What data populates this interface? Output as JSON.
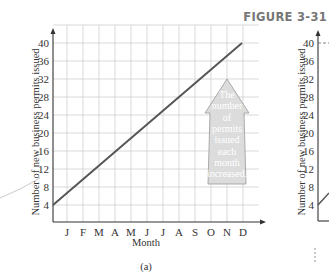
{
  "figure_title": "FIGURE 3-31",
  "panel_a_label": "(a)",
  "chart_data": [
    {
      "type": "line",
      "panel": "(a)",
      "title": "",
      "xlabel": "Month",
      "ylabel": "Number of new business permits issued",
      "categories": [
        "J",
        "F",
        "M",
        "A",
        "M",
        "J",
        "J",
        "A",
        "S",
        "O",
        "N",
        "D"
      ],
      "y_ticks": [
        4,
        8,
        12,
        16,
        20,
        24,
        28,
        32,
        36,
        40
      ],
      "ylim": [
        0,
        42
      ],
      "grid": true,
      "series": [
        {
          "name": "New business permits",
          "x": [
            0,
            12
          ],
          "values": [
            4,
            40
          ]
        }
      ],
      "annotation": {
        "type": "up-arrow",
        "lines": [
          "The",
          "number",
          "of",
          "permits",
          "issued",
          "each",
          "month",
          "increased."
        ]
      }
    },
    {
      "type": "line",
      "panel": "(b) partial",
      "ylabel": "Number of new business permits issued",
      "y_ticks": [
        4,
        8,
        12,
        16,
        20,
        24,
        28,
        32,
        36,
        40
      ],
      "ylim": [
        0,
        42
      ],
      "grid": false,
      "partial": true
    }
  ]
}
